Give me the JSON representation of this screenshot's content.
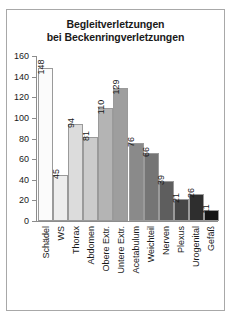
{
  "chart_data": {
    "type": "bar",
    "title": "Begleitverletzungen bei Beckenringverletzungen",
    "title_line1": "Begleitverletzungen",
    "title_line2": "bei Beckenringverletzungen",
    "xlabel": "",
    "ylabel": "",
    "ylim": [
      0,
      160
    ],
    "ytick_step": 20,
    "yticks": [
      160,
      140,
      120,
      100,
      80,
      60,
      40,
      20,
      0
    ],
    "grid": false,
    "legend": false,
    "categories": [
      "Schädel",
      "WS",
      "Thorax",
      "Abdomen",
      "Obere Extr.",
      "Untere Extr.",
      "Acetabulum",
      "Weichteil",
      "Nerven",
      "Plexus",
      "Urogenital",
      "Gefäß"
    ],
    "values": [
      148,
      45,
      94,
      81,
      110,
      129,
      76,
      66,
      39,
      21,
      26,
      11
    ],
    "bar_colors": [
      "#fbfbfb",
      "#ededed",
      "#dcdcdc",
      "#cbcbcb",
      "#b4b4b4",
      "#9e9e9e",
      "#8a8a8a",
      "#757575",
      "#5e5e5e",
      "#464646",
      "#2e2e2e",
      "#151515"
    ]
  },
  "frame": {
    "border_color": "#a8a8a8",
    "axis_color": "#8c8c8c",
    "text_color": "#1a1a1a"
  }
}
